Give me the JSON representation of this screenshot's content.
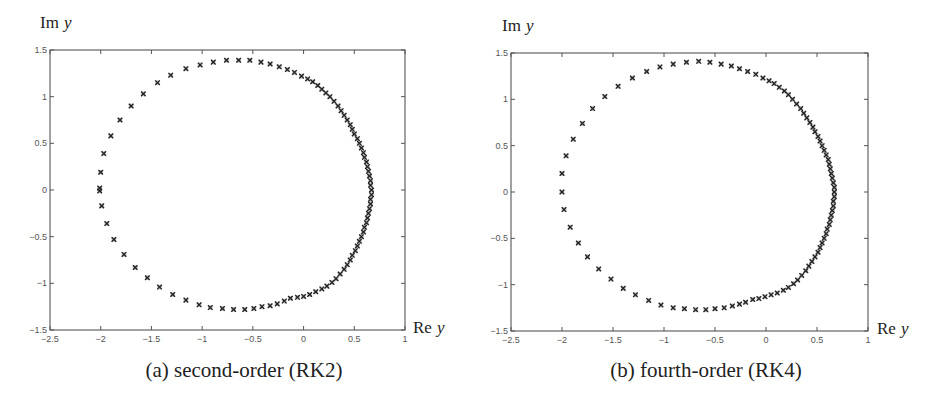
{
  "chart_data": [
    {
      "id": "rk2",
      "type": "scatter",
      "caption": "(a) second-order (RK2)",
      "xlabel_main": "Re",
      "xlabel_var": "y",
      "ylabel_main": "Im",
      "ylabel_var": "y",
      "xlim": [
        -2.5,
        1
      ],
      "ylim": [
        -1.5,
        1.5
      ],
      "xticks": [
        -2.5,
        -2,
        -1.5,
        -1,
        -0.5,
        0,
        0.5,
        1
      ],
      "xtick_labels": [
        "-2.5",
        "-2",
        "-1.5",
        "-1",
        "-0.5",
        "0",
        "0.5",
        "1"
      ],
      "yticks": [
        -1.5,
        -1,
        -0.5,
        0,
        0.5,
        1,
        1.5
      ],
      "ytick_labels": [
        "-1.5",
        "-1",
        "-0.5",
        "0",
        "0.5",
        "1",
        "1.5"
      ],
      "grid": false,
      "marker": "x",
      "points": [
        [
          -2.01,
          0.02
        ],
        [
          -2.01,
          -0.01
        ],
        [
          -2.0,
          0.19
        ],
        [
          -1.97,
          0.39
        ],
        [
          -1.9,
          0.58
        ],
        [
          -1.81,
          0.75
        ],
        [
          -1.7,
          0.9
        ],
        [
          -1.58,
          1.03
        ],
        [
          -1.44,
          1.15
        ],
        [
          -1.31,
          1.23
        ],
        [
          -1.16,
          1.3
        ],
        [
          -1.02,
          1.34
        ],
        [
          -0.89,
          1.37
        ],
        [
          -0.76,
          1.39
        ],
        [
          -0.64,
          1.39
        ],
        [
          -0.53,
          1.39
        ],
        [
          -0.42,
          1.37
        ],
        [
          -0.33,
          1.35
        ],
        [
          -0.24,
          1.32
        ],
        [
          -0.16,
          1.29
        ],
        [
          -0.09,
          1.26
        ],
        [
          -0.02,
          1.22
        ],
        [
          0.04,
          1.19
        ],
        [
          0.09,
          1.16
        ],
        [
          0.14,
          1.12
        ],
        [
          0.18,
          1.08
        ],
        [
          0.22,
          1.04
        ],
        [
          0.26,
          1.0
        ],
        [
          0.3,
          0.95
        ],
        [
          0.34,
          0.9
        ],
        [
          0.37,
          0.85
        ],
        [
          0.4,
          0.8
        ],
        [
          0.43,
          0.75
        ],
        [
          0.46,
          0.7
        ],
        [
          0.48,
          0.65
        ],
        [
          0.5,
          0.6
        ],
        [
          0.53,
          0.55
        ],
        [
          0.55,
          0.5
        ],
        [
          0.57,
          0.45
        ],
        [
          0.59,
          0.4
        ],
        [
          0.6,
          0.35
        ],
        [
          0.62,
          0.3
        ],
        [
          0.63,
          0.25
        ],
        [
          0.64,
          0.2
        ],
        [
          0.65,
          0.15
        ],
        [
          0.66,
          0.1
        ],
        [
          0.66,
          0.05
        ],
        [
          0.67,
          0.0
        ],
        [
          0.67,
          -0.05
        ],
        [
          0.66,
          -0.1
        ],
        [
          0.66,
          -0.15
        ],
        [
          0.65,
          -0.2
        ],
        [
          0.64,
          -0.25
        ],
        [
          0.63,
          -0.3
        ],
        [
          0.62,
          -0.35
        ],
        [
          0.6,
          -0.4
        ],
        [
          0.59,
          -0.45
        ],
        [
          0.57,
          -0.5
        ],
        [
          0.55,
          -0.55
        ],
        [
          0.53,
          -0.6
        ],
        [
          0.51,
          -0.65
        ],
        [
          0.48,
          -0.7
        ],
        [
          0.46,
          -0.75
        ],
        [
          0.43,
          -0.8
        ],
        [
          0.4,
          -0.85
        ],
        [
          0.36,
          -0.9
        ],
        [
          0.32,
          -0.95
        ],
        [
          0.28,
          -0.99
        ],
        [
          0.23,
          -1.03
        ],
        [
          0.18,
          -1.06
        ],
        [
          0.12,
          -1.09
        ],
        [
          0.06,
          -1.12
        ],
        [
          0.0,
          -1.14
        ],
        [
          -0.06,
          -1.15
        ],
        [
          -0.13,
          -1.16
        ],
        [
          -0.19,
          -1.19
        ],
        [
          -0.26,
          -1.22
        ],
        [
          -0.33,
          -1.24
        ],
        [
          -0.41,
          -1.25
        ],
        [
          -0.49,
          -1.27
        ],
        [
          -0.58,
          -1.28
        ],
        [
          -0.69,
          -1.28
        ],
        [
          -0.8,
          -1.27
        ],
        [
          -0.92,
          -1.26
        ],
        [
          -1.03,
          -1.23
        ],
        [
          -1.16,
          -1.18
        ],
        [
          -1.29,
          -1.12
        ],
        [
          -1.42,
          -1.04
        ],
        [
          -1.54,
          -0.94
        ],
        [
          -1.66,
          -0.83
        ],
        [
          -1.77,
          -0.69
        ],
        [
          -1.87,
          -0.53
        ],
        [
          -1.94,
          -0.36
        ],
        [
          -1.99,
          -0.17
        ]
      ]
    },
    {
      "id": "rk4",
      "type": "scatter",
      "caption": "(b) fourth-order (RK4)",
      "xlabel_main": "Re",
      "xlabel_var": "y",
      "ylabel_main": "Im",
      "ylabel_var": "y",
      "xlim": [
        -2.5,
        1
      ],
      "ylim": [
        -1.5,
        1.5
      ],
      "xticks": [
        -2.5,
        -2,
        -1.5,
        -1,
        -0.5,
        0,
        0.5,
        1
      ],
      "xtick_labels": [
        "-2.5",
        "-2",
        "-1.5",
        "-1",
        "-0.5",
        "0",
        "0.5",
        "1"
      ],
      "yticks": [
        -1.5,
        -1,
        -0.5,
        0,
        0.5,
        1,
        1.5
      ],
      "ytick_labels": [
        "-1.5",
        "-1",
        "-0.5",
        "0",
        "0.5",
        "1",
        "1.5"
      ],
      "grid": false,
      "marker": "x",
      "points": [
        [
          -2.0,
          0.0
        ],
        [
          -2.0,
          0.2
        ],
        [
          -1.96,
          0.39
        ],
        [
          -1.89,
          0.57
        ],
        [
          -1.8,
          0.74
        ],
        [
          -1.7,
          0.9
        ],
        [
          -1.58,
          1.03
        ],
        [
          -1.45,
          1.14
        ],
        [
          -1.31,
          1.23
        ],
        [
          -1.17,
          1.3
        ],
        [
          -1.04,
          1.35
        ],
        [
          -0.91,
          1.38
        ],
        [
          -0.78,
          1.4
        ],
        [
          -0.66,
          1.41
        ],
        [
          -0.55,
          1.4
        ],
        [
          -0.44,
          1.38
        ],
        [
          -0.34,
          1.36
        ],
        [
          -0.26,
          1.33
        ],
        [
          -0.18,
          1.3
        ],
        [
          -0.1,
          1.27
        ],
        [
          -0.03,
          1.23
        ],
        [
          0.03,
          1.2
        ],
        [
          0.08,
          1.17
        ],
        [
          0.13,
          1.13
        ],
        [
          0.18,
          1.09
        ],
        [
          0.22,
          1.05
        ],
        [
          0.26,
          1.0
        ],
        [
          0.3,
          0.95
        ],
        [
          0.34,
          0.9
        ],
        [
          0.37,
          0.85
        ],
        [
          0.4,
          0.8
        ],
        [
          0.43,
          0.75
        ],
        [
          0.46,
          0.7
        ],
        [
          0.48,
          0.65
        ],
        [
          0.51,
          0.6
        ],
        [
          0.53,
          0.55
        ],
        [
          0.55,
          0.5
        ],
        [
          0.57,
          0.45
        ],
        [
          0.59,
          0.4
        ],
        [
          0.61,
          0.35
        ],
        [
          0.62,
          0.3
        ],
        [
          0.63,
          0.25
        ],
        [
          0.64,
          0.2
        ],
        [
          0.65,
          0.15
        ],
        [
          0.66,
          0.1
        ],
        [
          0.67,
          0.05
        ],
        [
          0.67,
          0.0
        ],
        [
          0.67,
          -0.05
        ],
        [
          0.66,
          -0.1
        ],
        [
          0.66,
          -0.15
        ],
        [
          0.65,
          -0.2
        ],
        [
          0.64,
          -0.25
        ],
        [
          0.63,
          -0.3
        ],
        [
          0.62,
          -0.35
        ],
        [
          0.6,
          -0.4
        ],
        [
          0.59,
          -0.45
        ],
        [
          0.57,
          -0.5
        ],
        [
          0.55,
          -0.55
        ],
        [
          0.53,
          -0.6
        ],
        [
          0.51,
          -0.65
        ],
        [
          0.48,
          -0.7
        ],
        [
          0.45,
          -0.75
        ],
        [
          0.42,
          -0.8
        ],
        [
          0.39,
          -0.85
        ],
        [
          0.35,
          -0.9
        ],
        [
          0.31,
          -0.95
        ],
        [
          0.27,
          -0.99
        ],
        [
          0.22,
          -1.03
        ],
        [
          0.17,
          -1.06
        ],
        [
          0.11,
          -1.09
        ],
        [
          0.05,
          -1.11
        ],
        [
          -0.01,
          -1.13
        ],
        [
          -0.07,
          -1.15
        ],
        [
          -0.13,
          -1.16
        ],
        [
          -0.2,
          -1.19
        ],
        [
          -0.26,
          -1.21
        ],
        [
          -0.33,
          -1.23
        ],
        [
          -0.41,
          -1.25
        ],
        [
          -0.5,
          -1.26
        ],
        [
          -0.59,
          -1.27
        ],
        [
          -0.69,
          -1.27
        ],
        [
          -0.8,
          -1.26
        ],
        [
          -0.91,
          -1.25
        ],
        [
          -1.03,
          -1.22
        ],
        [
          -1.15,
          -1.17
        ],
        [
          -1.28,
          -1.11
        ],
        [
          -1.4,
          -1.04
        ],
        [
          -1.52,
          -0.94
        ],
        [
          -1.64,
          -0.83
        ],
        [
          -1.75,
          -0.7
        ],
        [
          -1.84,
          -0.55
        ],
        [
          -1.92,
          -0.38
        ],
        [
          -1.98,
          -0.19
        ]
      ]
    }
  ]
}
